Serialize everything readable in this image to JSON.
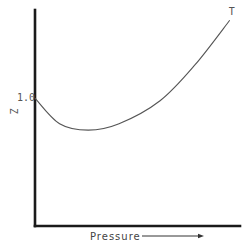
{
  "chart_data": {
    "type": "line",
    "title": "",
    "xlabel": "Pressure",
    "xlabel_arrow": true,
    "ylabel": "Z",
    "y_tick_labels": [
      "1.0"
    ],
    "y_ticks": [
      1.0
    ],
    "xlim": [
      0,
      1
    ],
    "ylim": [
      0,
      1.69
    ],
    "grid": false,
    "legend": "none",
    "series": [
      {
        "name": "T",
        "label_at_end": "T",
        "x": [
          0.0,
          0.12,
          0.26,
          0.41,
          0.61,
          0.78,
          0.95
        ],
        "y": [
          1.0,
          0.8,
          0.75,
          0.8,
          0.98,
          1.26,
          1.61
        ]
      }
    ],
    "colors": {
      "axis": "#1a1a1a",
      "curve": "#555555",
      "text": "#555555"
    }
  }
}
